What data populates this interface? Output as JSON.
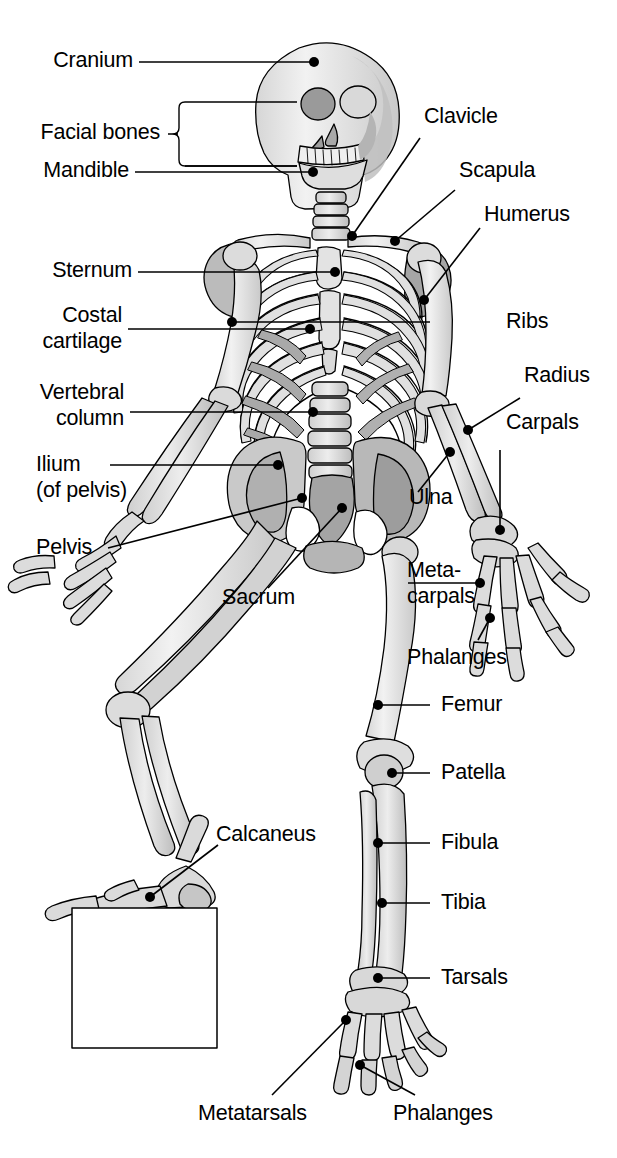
{
  "figure": {
    "line_color": "#000000",
    "bone_fill": "#e8e8e8",
    "bone_shade": "#b9b9b9",
    "bone_shade_dark": "#8f8f8f",
    "background": "#ffffff",
    "text_color": "#000000"
  },
  "labels": {
    "cranium": "Cranium",
    "facial_bones": "Facial bones",
    "mandible": "Mandible",
    "clavicle": "Clavicle",
    "scapula": "Scapula",
    "humerus": "Humerus",
    "sternum": "Sternum",
    "costal_line1": "Costal",
    "costal_line2": "cartilage",
    "ribs": "Ribs",
    "vertebral_line1": "Vertebral",
    "vertebral_line2": "column",
    "radius": "Radius",
    "carpals": "Carpals",
    "ulna": "Ulna",
    "ilium_line1": "Ilium",
    "ilium_line2": "(of pelvis)",
    "pelvis": "Pelvis",
    "sacrum": "Sacrum",
    "metacarpals_line1": "Meta-",
    "metacarpals_line2": "carpals",
    "phalanges_hand": "Phalanges",
    "femur": "Femur",
    "patella": "Patella",
    "calcaneus": "Calcaneus",
    "fibula": "Fibula",
    "tibia": "Tibia",
    "tarsals": "Tarsals",
    "metatarsals": "Metatarsals",
    "phalanges_foot": "Phalanges"
  }
}
